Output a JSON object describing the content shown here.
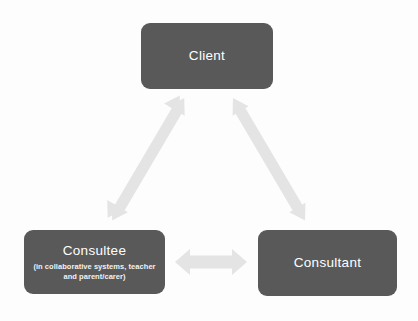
{
  "diagram": {
    "type": "triangle-relationship-diagram",
    "background_color": "#fdfdfd",
    "node_fill_color": "#595959",
    "node_text_color": "#ffffff",
    "arrow_color": "#e4e4e4",
    "nodes": [
      {
        "id": "client",
        "label": "Client",
        "subtitle": "",
        "position": "top-center"
      },
      {
        "id": "consultee",
        "label": "Consultee",
        "subtitle": "(in collaborative systems, teacher and parent/carer)",
        "position": "bottom-left"
      },
      {
        "id": "consultant",
        "label": "Consultant",
        "subtitle": "",
        "position": "bottom-right"
      }
    ],
    "connections": [
      {
        "id": "consultee-client",
        "from": "consultee",
        "to": "client",
        "style": "double-headed-arrow"
      },
      {
        "id": "client-consultant",
        "from": "client",
        "to": "consultant",
        "style": "double-headed-arrow"
      },
      {
        "id": "consultee-consultant",
        "from": "consultee",
        "to": "consultant",
        "style": "double-headed-arrow"
      }
    ]
  }
}
